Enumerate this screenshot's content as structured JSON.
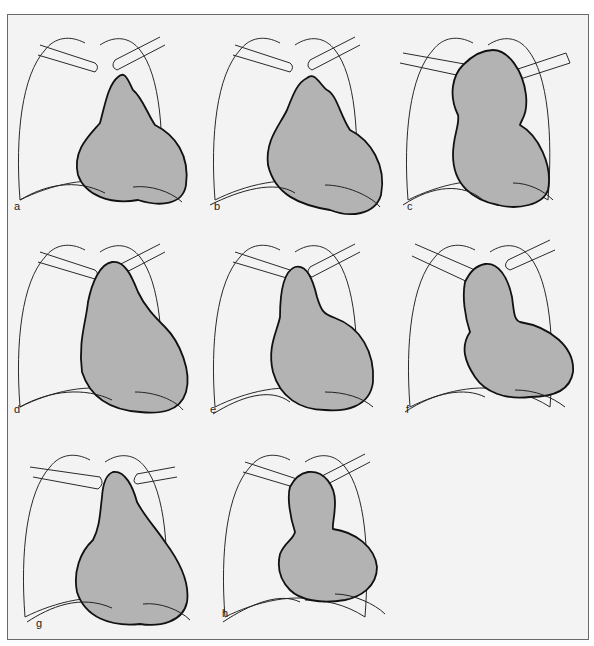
{
  "figure": {
    "panels": [
      {
        "id": "a",
        "label": "a"
      },
      {
        "id": "b",
        "label": "b"
      },
      {
        "id": "c",
        "label": "c"
      },
      {
        "id": "d",
        "label": "d"
      },
      {
        "id": "e",
        "label": "e"
      },
      {
        "id": "f",
        "label": "f"
      },
      {
        "id": "g",
        "label": "g"
      },
      {
        "id": "h",
        "label": "h"
      }
    ],
    "colors": {
      "heart_fill": "#b3b3b3",
      "outline": "#111111",
      "background": "#f3f3f3"
    }
  }
}
